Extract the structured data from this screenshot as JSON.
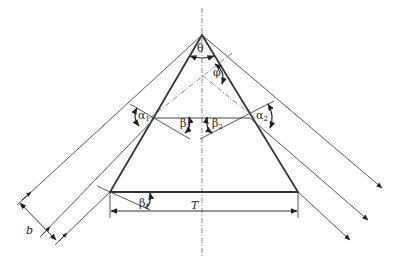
{
  "diagram": {
    "type": "prism ray-tracing geometry",
    "colors": {
      "line": "#333333",
      "thin_line": "#444444",
      "axis": "#888888",
      "background": "#ffffff"
    },
    "labels": {
      "theta": "θ",
      "phi": "φ",
      "alpha1": "α",
      "alpha1_sub": "1",
      "alpha2": "α",
      "alpha2_sub": "2",
      "beta1": "β",
      "beta1_sub": "1",
      "beta2": "β",
      "beta2_sub": "2",
      "beta_base": "β",
      "beta_base_sub": "1",
      "T": "T",
      "b": "b"
    },
    "elements": [
      "prism (isosceles triangle) with apex angle θ",
      "vertical dash-dot symmetry axis",
      "dash-dot normal lines",
      "three parallel incident rays from lower-left",
      "three parallel exiting rays to lower-right",
      "internal horizontal ray",
      "beam width dimension b",
      "base width dimension T"
    ]
  }
}
